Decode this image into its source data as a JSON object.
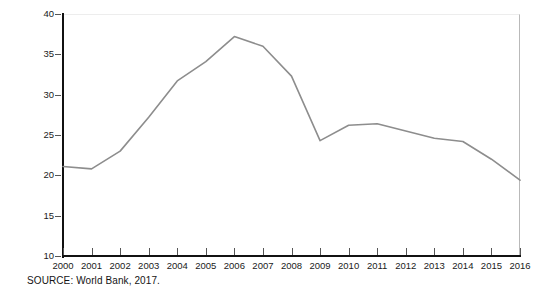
{
  "figure": {
    "source_note": "SOURCE: World Bank, 2017.",
    "line_color": "#8d8d8d",
    "axis_color": "#111111",
    "text_color": "#1a1a1a",
    "axis_title_color": "#1a1a2e"
  },
  "chart_data": {
    "type": "line",
    "title": "",
    "subtitle": "",
    "xlabel": "",
    "ylabel": "Percentage of GDP",
    "xlim": [
      2000,
      2016
    ],
    "ylim": [
      10,
      40
    ],
    "yticks": [
      10,
      15,
      20,
      25,
      30,
      35,
      40
    ],
    "ytick_labels": [
      "10",
      "15",
      "20",
      "25",
      "30",
      "35",
      "40"
    ],
    "grid": false,
    "legend": false,
    "legend_position": "none",
    "categories": [
      2000,
      2001,
      2002,
      2003,
      2004,
      2005,
      2006,
      2007,
      2008,
      2009,
      2010,
      2011,
      2012,
      2013,
      2014,
      2015,
      2016
    ],
    "xtick_labels": [
      "2000",
      "2001",
      "2002",
      "2003",
      "2004",
      "2005",
      "2006",
      "2007",
      "2008",
      "2009",
      "2010",
      "2011",
      "2012",
      "2013",
      "2014",
      "2015",
      "2016"
    ],
    "values": [
      21.1,
      20.8,
      23.0,
      27.2,
      31.7,
      34.1,
      37.2,
      36.0,
      32.3,
      24.3,
      26.2,
      26.4,
      25.5,
      24.6,
      24.2,
      22.0,
      19.4
    ],
    "series": [
      {
        "name": "Percentage of GDP",
        "values": [
          21.1,
          20.8,
          23.0,
          27.2,
          31.7,
          34.1,
          37.2,
          36.0,
          32.3,
          24.3,
          26.2,
          26.4,
          25.5,
          24.6,
          24.2,
          22.0,
          19.4
        ]
      }
    ],
    "annotations": []
  }
}
